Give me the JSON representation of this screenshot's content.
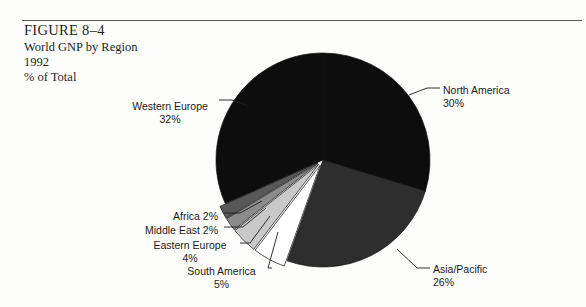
{
  "figure": {
    "number": "FIGURE 8–4",
    "title": "World GNP by Region",
    "year": "1992",
    "units": "% of Total"
  },
  "chart_data": {
    "type": "pie",
    "title": "World GNP by Region",
    "subtitle": "1992",
    "value_unit": "% of Total",
    "start_angle_deg": 0,
    "direction": "clockwise",
    "legend": "none",
    "labels_position": "outside-with-leader-lines",
    "categories": [
      "North America",
      "Asia/Pacific",
      "South America",
      "Eastern Europe",
      "Middle East",
      "Africa",
      "Western Europe"
    ],
    "values": [
      30,
      26,
      5,
      4,
      2,
      2,
      32
    ],
    "total": 101,
    "slices": [
      {
        "name": "North America",
        "value": 30,
        "label": "North America",
        "pct_text": "30%",
        "color": "#0d0d0d",
        "exploded": false
      },
      {
        "name": "Asia/Pacific",
        "value": 26,
        "label": "Asia/Pacific",
        "pct_text": "26%",
        "color": "#2e2e2e",
        "exploded": false
      },
      {
        "name": "South America",
        "value": 5,
        "label": "South America",
        "pct_text": "5%",
        "color": "#ffffff",
        "exploded": true
      },
      {
        "name": "Eastern Europe",
        "value": 4,
        "label": "Eastern Europe",
        "pct_text": "4%",
        "color": "#c9c9c9",
        "exploded": true
      },
      {
        "name": "Middle East",
        "value": 2,
        "label": "Middle East",
        "pct_text": "2%",
        "color": "#8c8c8c",
        "exploded": true
      },
      {
        "name": "Africa",
        "value": 2,
        "label": "Africa",
        "pct_text": "2%",
        "color": "#585858",
        "exploded": true
      },
      {
        "name": "Western Europe",
        "value": 32,
        "label": "Western Europe",
        "pct_text": "32%",
        "color": "#0d0d0d",
        "exploded": false
      }
    ]
  },
  "labels": {
    "north_america": {
      "name": "North America",
      "pct": "30%"
    },
    "asia_pacific": {
      "name": "Asia/Pacific",
      "pct": "26%"
    },
    "western_europe": {
      "name": "Western Europe",
      "pct": "32%"
    },
    "africa": {
      "name": "Africa",
      "pct": "2%"
    },
    "middle_east": {
      "name": "Middle East",
      "pct": "2%"
    },
    "eastern_europe": {
      "name": "Eastern Europe",
      "pct": "4%"
    },
    "south_america": {
      "name": "South America",
      "pct": "5%"
    }
  }
}
